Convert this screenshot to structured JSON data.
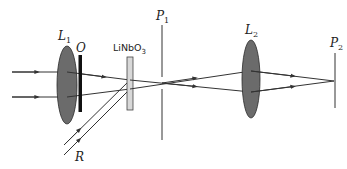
{
  "diagram": {
    "labels": {
      "lens1": {
        "main": "L",
        "sub": "1"
      },
      "object": "O",
      "crystal": {
        "main": "LiNbO",
        "sub": "3"
      },
      "pinhole1": {
        "main": "P",
        "sub": "1"
      },
      "lens2": {
        "main": "L",
        "sub": "2"
      },
      "plane2": {
        "main": "P",
        "sub": "2"
      },
      "reference": "R"
    },
    "colors": {
      "lens_fill": "#6b6b6b",
      "lens_stroke": "#2a2a2a",
      "line": "#333333",
      "object_bar": "#111111",
      "crystal_fill": "#d8d8d8"
    },
    "components": [
      "L1 (lens)",
      "O (object)",
      "LiNbO3 (crystal)",
      "P1 (aperture plane)",
      "L2 (lens)",
      "P2 (output plane)"
    ],
    "beams": [
      "object beam (upper)",
      "object beam (lower)",
      "reference beam R (two rays)"
    ]
  }
}
